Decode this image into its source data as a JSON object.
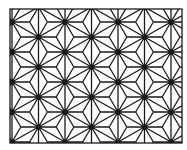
{
  "image": {
    "description": "Asanoha (hemp leaf) geometric pattern",
    "stroke_color": "#1a1a1a",
    "background_color": "#ffffff",
    "frame": {
      "x": 10,
      "y": 9,
      "width": 172,
      "height": 134
    }
  },
  "pattern": {
    "type": "asanoha",
    "col_spacing": 26.5,
    "row_spacing": 30,
    "origin_x": 12,
    "origin_y": 22,
    "stroke_width": 1.3,
    "star_dot_radius": 2.2
  }
}
